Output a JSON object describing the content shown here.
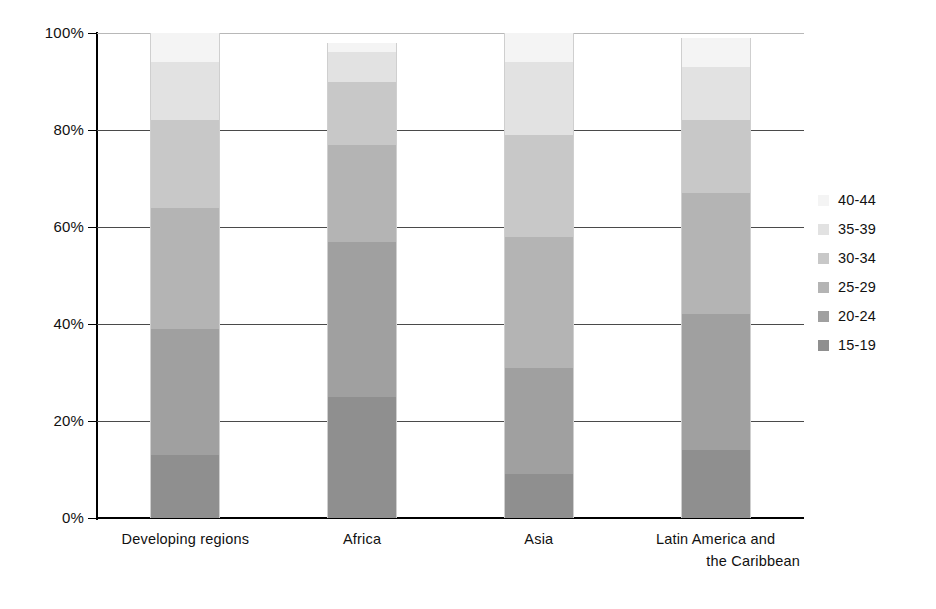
{
  "chart_data": {
    "type": "bar",
    "subtype": "stacked-percent",
    "title": "",
    "xlabel": "",
    "ylabel": "",
    "ylim": [
      0,
      100
    ],
    "y_ticks": [
      "0%",
      "20%",
      "40%",
      "60%",
      "80%",
      "100%"
    ],
    "y_tick_values": [
      0,
      20,
      40,
      60,
      80,
      100
    ],
    "grid": true,
    "legend_position": "right",
    "categories": [
      "Developing regions",
      "Africa",
      "Asia",
      "Latin America and the Caribbean"
    ],
    "category_label_lines": [
      [
        "Developing regions"
      ],
      [
        "Africa"
      ],
      [
        "Asia"
      ],
      [
        "Latin America and",
        "the Caribbean"
      ]
    ],
    "series": [
      {
        "name": "15-19",
        "color": "#8f8f8f",
        "values": [
          13,
          25,
          9,
          14
        ]
      },
      {
        "name": "20-24",
        "color": "#a0a0a0",
        "values": [
          26,
          32,
          22,
          28
        ]
      },
      {
        "name": "25-29",
        "color": "#b4b4b4",
        "values": [
          25,
          20,
          27,
          25
        ]
      },
      {
        "name": "30-34",
        "color": "#c8c8c8",
        "values": [
          18,
          13,
          21,
          15
        ]
      },
      {
        "name": "35-39",
        "color": "#e2e2e2",
        "values": [
          12,
          6,
          15,
          11
        ]
      },
      {
        "name": "40-44",
        "color": "#f4f4f4",
        "values": [
          6,
          2,
          6,
          6
        ]
      }
    ],
    "totals": [
      100,
      98,
      100,
      100
    ]
  },
  "legend": {
    "entries": [
      {
        "label": "40-44",
        "color": "#f4f4f4"
      },
      {
        "label": "35-39",
        "color": "#e2e2e2"
      },
      {
        "label": "30-34",
        "color": "#c8c8c8"
      },
      {
        "label": "25-29",
        "color": "#b4b4b4"
      },
      {
        "label": "20-24",
        "color": "#a0a0a0"
      },
      {
        "label": "15-19",
        "color": "#8f8f8f"
      }
    ]
  },
  "axis": {
    "y_labels": [
      "100%",
      "80%",
      "60%",
      "40%",
      "20%",
      "0%"
    ]
  }
}
